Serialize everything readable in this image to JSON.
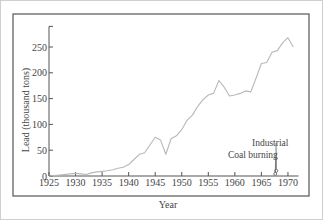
{
  "chart_data": {
    "type": "line",
    "title": "",
    "xlabel": "Year",
    "ylabel": "Lead (thousand tons)",
    "xlim": [
      1925,
      1972
    ],
    "ylim": [
      0,
      290
    ],
    "x_ticks": [
      1925,
      1930,
      1935,
      1940,
      1945,
      1950,
      1955,
      1960,
      1965,
      1970
    ],
    "y_ticks": [
      0,
      50,
      100,
      150,
      200,
      250
    ],
    "grid": false,
    "legend": null,
    "series": [
      {
        "name": "Lead",
        "x": [
          1925,
          1927,
          1929,
          1930,
          1931,
          1932,
          1933,
          1934,
          1935,
          1936,
          1937,
          1938,
          1939,
          1940,
          1941,
          1942,
          1943,
          1944,
          1945,
          1946,
          1947,
          1948,
          1949,
          1950,
          1951,
          1952,
          1953,
          1954,
          1955,
          1956,
          1957,
          1958,
          1959,
          1960,
          1961,
          1962,
          1963,
          1964,
          1965,
          1966,
          1967,
          1968,
          1969,
          1970,
          1971
        ],
        "values": [
          0,
          2,
          4,
          5,
          4,
          3,
          6,
          8,
          9,
          10,
          12,
          15,
          17,
          22,
          32,
          42,
          45,
          60,
          75,
          70,
          42,
          72,
          78,
          90,
          108,
          118,
          135,
          148,
          157,
          160,
          185,
          172,
          155,
          157,
          160,
          165,
          163,
          190,
          218,
          220,
          240,
          243,
          258,
          268,
          250
        ]
      }
    ],
    "annotations": [
      {
        "text": "Industrial",
        "x": 1967.8,
        "y": 10
      },
      {
        "text": "Coal burning",
        "x": 1967.6,
        "y": 4
      }
    ]
  }
}
